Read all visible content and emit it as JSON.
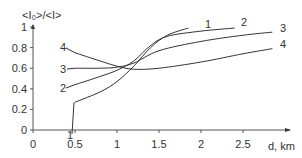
{
  "chart_data": {
    "type": "line",
    "title": "",
    "xlabel": "d, km",
    "ylabel": "<I₀>/<I>",
    "xlim": [
      0,
      2.75
    ],
    "ylim": [
      0,
      1
    ],
    "xticks": [
      0,
      0.5,
      1,
      1.5,
      2,
      2.5
    ],
    "xtick_labels": [
      "0",
      "0.5",
      "1",
      "1.5",
      "2",
      "2.5"
    ],
    "yticks": [
      0,
      0.2,
      0.4,
      0.6,
      0.8,
      1
    ],
    "ytick_labels": [
      "0",
      "0.2",
      "0.4",
      "0.6",
      "0.8",
      "1"
    ],
    "grid": false,
    "legend": "inline labels at curve ends",
    "series": [
      {
        "name": "1",
        "x": [
          0.5,
          0.8,
          1.0,
          1.2,
          1.4,
          1.6,
          1.85
        ],
        "y": [
          0.27,
          0.37,
          0.47,
          0.62,
          0.8,
          0.92,
          0.99
        ]
      },
      {
        "name": "2",
        "x": [
          0.5,
          0.8,
          1.0,
          1.2,
          1.4,
          1.6,
          2.0,
          2.4
        ],
        "y": [
          0.44,
          0.52,
          0.58,
          0.67,
          0.82,
          0.91,
          0.96,
          0.99
        ]
      },
      {
        "name": "3",
        "x": [
          0.5,
          0.8,
          1.0,
          1.2,
          1.5,
          2.0,
          2.5,
          2.85
        ],
        "y": [
          0.6,
          0.6,
          0.61,
          0.65,
          0.77,
          0.86,
          0.92,
          0.95
        ]
      },
      {
        "name": "4",
        "x": [
          0.5,
          0.8,
          1.0,
          1.2,
          1.5,
          2.0,
          2.5,
          2.85
        ],
        "y": [
          0.75,
          0.67,
          0.62,
          0.59,
          0.6,
          0.66,
          0.74,
          0.79
        ]
      }
    ]
  }
}
